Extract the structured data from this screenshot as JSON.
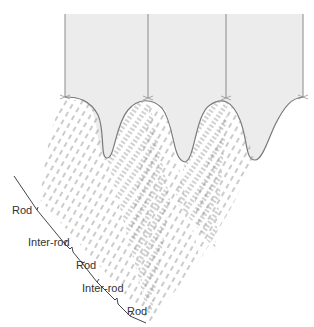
{
  "diagram": {
    "labels": [
      {
        "text": "Rod",
        "x": 12,
        "y": 214
      },
      {
        "text": "Inter-rod",
        "x": 28,
        "y": 246
      },
      {
        "text": "Rod",
        "x": 76,
        "y": 269
      },
      {
        "text": "Inter-rod",
        "x": 82,
        "y": 292
      },
      {
        "text": "Rod",
        "x": 127,
        "y": 315
      }
    ],
    "colors": {
      "cell_fill": "#ececec",
      "cell_line": "#8a8a8a",
      "dash": "#8c8c8c",
      "bracket": "#444444",
      "label": "#333333"
    }
  }
}
